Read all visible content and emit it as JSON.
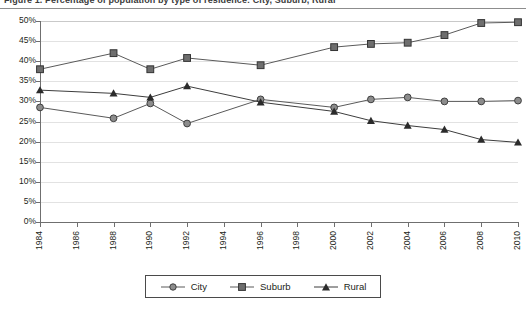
{
  "title": {
    "text": "Figure 1. Percentage of population by type of residence: City, Suburb, Rural",
    "clipped": true
  },
  "legend": {
    "position": "bottom-center",
    "items": [
      {
        "label": "City",
        "marker": "circle",
        "color": "#8c8c8c",
        "line_color": "#5a5a5a"
      },
      {
        "label": "Suburb",
        "marker": "square",
        "color": "#6e6e6e",
        "line_color": "#5a5a5a"
      },
      {
        "label": "Rural",
        "marker": "triangle",
        "color": "#2b2b2b",
        "line_color": "#3d3d3d"
      }
    ]
  },
  "axes": {
    "y_ticks": [
      "0%",
      "5%",
      "10%",
      "15%",
      "20%",
      "25%",
      "30%",
      "35%",
      "40%",
      "45%",
      "50%"
    ],
    "x_ticks": [
      "1984",
      "1986",
      "1988",
      "1990",
      "1992",
      "1994",
      "1996",
      "1998",
      "2000",
      "2002",
      "2004",
      "2006",
      "2008",
      "2010"
    ]
  },
  "chart_data": {
    "type": "line",
    "title": "Figure 1. Percentage of population by type of residence: City, Suburb, Rural",
    "xlabel": "",
    "ylabel": "",
    "ylim": [
      0,
      50
    ],
    "xlim": [
      1984,
      2010
    ],
    "ytick_format": "percent",
    "grid": true,
    "legend_position": "bottom-center",
    "x": [
      1984,
      1988,
      1990,
      1992,
      1996,
      2000,
      2002,
      2004,
      2006,
      2008,
      2010
    ],
    "series": [
      {
        "name": "City",
        "marker": "circle",
        "values": [
          28.5,
          25.8,
          29.5,
          24.5,
          30.5,
          28.5,
          30.5,
          31.0,
          30.0,
          30.0,
          30.2
        ]
      },
      {
        "name": "Suburb",
        "marker": "square",
        "values": [
          38.0,
          42.0,
          38.0,
          40.8,
          39.0,
          43.5,
          44.3,
          44.6,
          46.5,
          49.5,
          49.7
        ]
      },
      {
        "name": "Rural",
        "marker": "triangle",
        "values": [
          32.8,
          32.0,
          31.0,
          33.8,
          29.8,
          27.5,
          25.2,
          24.0,
          23.0,
          20.5,
          19.8
        ]
      }
    ]
  }
}
